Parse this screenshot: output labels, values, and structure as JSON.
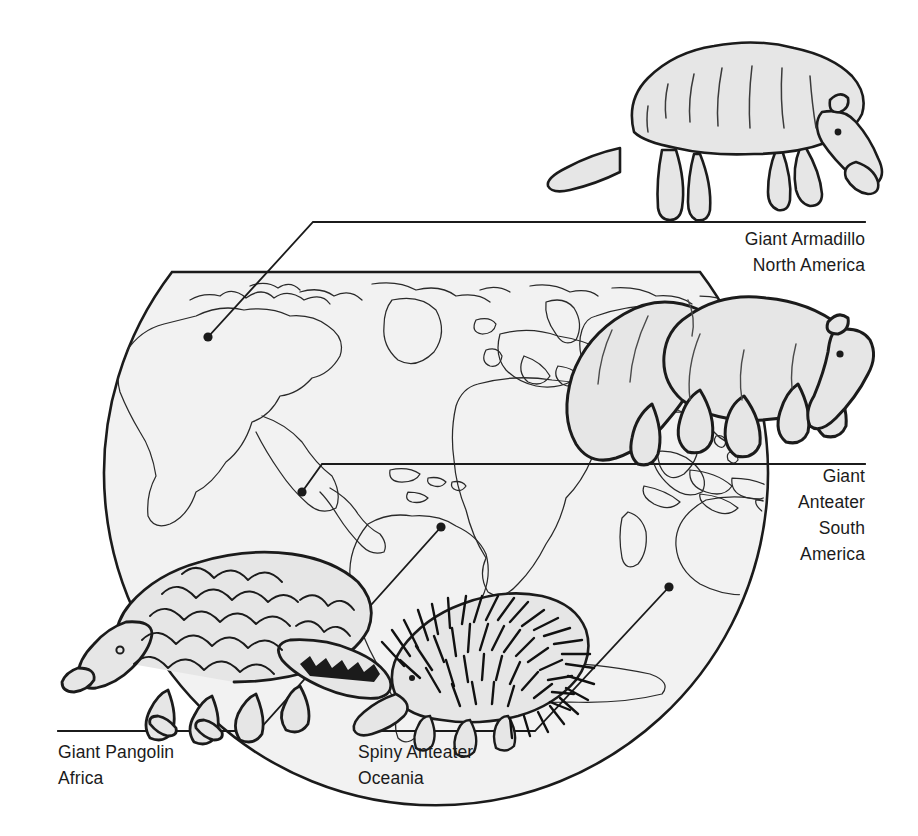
{
  "figure": {
    "background_color": "#ffffff",
    "ink_color": "#1b1b1b",
    "fill_color": "#e8e8e8",
    "width": 918,
    "height": 836
  },
  "globe": {
    "name": "world-map-globe",
    "description": "Flat-topped circular world map showing continents in outline",
    "continents": [
      "North America",
      "South America",
      "Africa",
      "Europe",
      "Asia",
      "Australia",
      "Antarctica"
    ]
  },
  "callouts": [
    {
      "key": "armadillo",
      "animal": "Giant Armadillo",
      "region": "North America",
      "lines": [
        "Giant Armadillo",
        "North America"
      ],
      "align": "right",
      "marker": {
        "x": 208,
        "y": 337
      }
    },
    {
      "key": "anteater",
      "animal": "Giant Anteater",
      "region": "South America",
      "lines": [
        "Giant",
        "Anteater",
        "South",
        "America"
      ],
      "align": "right",
      "marker": {
        "x": 302,
        "y": 492
      }
    },
    {
      "key": "pangolin",
      "animal": "Giant Pangolin",
      "region": "Africa",
      "lines": [
        "Giant Pangolin",
        "Africa"
      ],
      "align": "left",
      "marker": {
        "x": 441,
        "y": 527
      }
    },
    {
      "key": "spiny",
      "animal": "Spiny Anteater",
      "region": "Oceania",
      "lines": [
        "Spiny Anteater",
        "Oceania"
      ],
      "align": "left",
      "marker": {
        "x": 669,
        "y": 587
      }
    }
  ],
  "animals": [
    {
      "key": "armadillo",
      "name": "giant-armadillo-illustration",
      "facing": "right"
    },
    {
      "key": "anteater",
      "name": "giant-anteater-illustration",
      "facing": "right"
    },
    {
      "key": "pangolin",
      "name": "giant-pangolin-illustration",
      "facing": "left"
    },
    {
      "key": "spiny",
      "name": "spiny-anteater-illustration",
      "facing": "left"
    }
  ]
}
